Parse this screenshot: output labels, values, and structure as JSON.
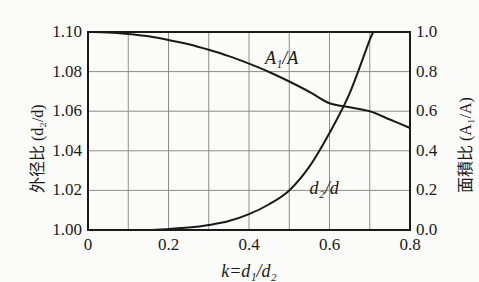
{
  "chart_data": {
    "type": "line",
    "title": "",
    "xlabel": "k = d1/d2",
    "xlabel_display": "k=d₁/d₂",
    "ylabel_left": "外径比 (d₂/d)",
    "ylabel_right": "面積比 (A₁/A)",
    "xlim": [
      0,
      0.8
    ],
    "ylim_left": [
      1.0,
      1.1
    ],
    "ylim_right": [
      0.0,
      1.0
    ],
    "xticks": [
      "0",
      "0.2",
      "0.4",
      "0.6",
      "0.8"
    ],
    "xtick_values": [
      0,
      0.2,
      0.4,
      0.6,
      0.8
    ],
    "yticks_left": [
      "1.00",
      "1.02",
      "1.04",
      "1.06",
      "1.08",
      "1.10"
    ],
    "ytick_values_left": [
      1.0,
      1.02,
      1.04,
      1.06,
      1.08,
      1.1
    ],
    "yticks_right": [
      "0.0",
      "0.2",
      "0.4",
      "0.6",
      "0.8",
      "1.0"
    ],
    "ytick_values_right": [
      0.0,
      0.2,
      0.4,
      0.6,
      0.8,
      1.0
    ],
    "grid": true,
    "grid_x_step": 0.1,
    "legend_position": "inline-annotations",
    "series": [
      {
        "name": "A1/A",
        "label_display": "A₁/A",
        "axis": "right",
        "x": [
          0.0,
          0.05,
          0.1,
          0.15,
          0.2,
          0.25,
          0.3,
          0.35,
          0.4,
          0.45,
          0.5,
          0.55,
          0.6,
          0.65,
          0.7,
          0.75,
          0.8
        ],
        "values": [
          1.0,
          0.998,
          0.99,
          0.978,
          0.96,
          0.938,
          0.91,
          0.878,
          0.84,
          0.798,
          0.75,
          0.698,
          0.64,
          0.66,
          0.6,
          0.558,
          0.515
        ]
      },
      {
        "name": "d2/d",
        "label_display": "d₂/d",
        "axis": "left",
        "x": [
          0.0,
          0.05,
          0.1,
          0.15,
          0.2,
          0.25,
          0.3,
          0.35,
          0.4,
          0.45,
          0.5,
          0.55,
          0.6,
          0.65,
          0.7,
          0.71
        ],
        "values": [
          1.0,
          1.0,
          1.0,
          1.0,
          1.0005,
          1.0012,
          1.0025,
          1.0045,
          1.008,
          1.013,
          1.02,
          1.032,
          1.049,
          1.069,
          1.096,
          1.1
        ]
      }
    ],
    "annotations": [
      {
        "text": "A₁/A",
        "x": 0.44,
        "y_right": 0.86
      },
      {
        "text": "d₂/d",
        "x": 0.55,
        "y_right": 0.2
      }
    ]
  },
  "axes": {
    "left_title": "外径比 (d₂/d)",
    "right_title": "面積比 (A₁/A)",
    "x_title": "k=d₁/d₂"
  },
  "colors": {
    "background": "#fbfbf9",
    "ink": "#1a1a1a",
    "grid": "#8c8c8c",
    "frame": "#1a1a1a"
  }
}
